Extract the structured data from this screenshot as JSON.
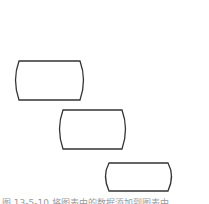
{
  "diagram": {
    "type": "staggered-shapes",
    "stroke_color": "#333333",
    "fill_color": "#ffffff",
    "shapes": [
      {
        "id": "box-1",
        "label": ""
      },
      {
        "id": "box-2",
        "label": ""
      },
      {
        "id": "box-3",
        "label": ""
      }
    ]
  },
  "caption": {
    "text": "图 13-5-10  将图表中的数据添加到图表中"
  }
}
